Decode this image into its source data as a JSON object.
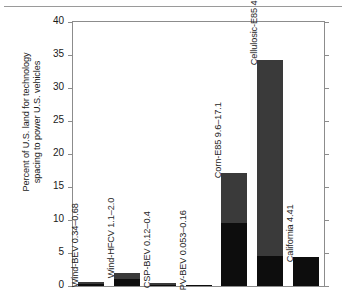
{
  "chart_data": {
    "type": "bar",
    "title": "",
    "xlabel": "",
    "ylabel": "Percent of U.S. land for technology spacing to power U.S. vehicles",
    "ylabel_line1": "Percent of U.S. land for technology",
    "ylabel_line2": "spacing to power U.S. vehicles",
    "ylim": [
      0,
      40
    ],
    "yticks": [
      0,
      5,
      10,
      15,
      20,
      25,
      30,
      35,
      40
    ],
    "ytick_labels": [
      "0",
      "5",
      "10",
      "15",
      "20",
      "25",
      "30",
      "35",
      "40"
    ],
    "grid": false,
    "legend": "none",
    "xtick_labels": [],
    "categories": [
      "Wind-BEV",
      "Wind-HFCV",
      "CSP-BEV",
      "PV-BEV",
      "Corn-E85",
      "Cellulosic-E85",
      "California"
    ],
    "bar_annotations": [
      "Wind-BEV 0.34–0.68",
      "Wind-HFCV 1.1–2.0",
      "CSP-BEV 0.12–0.4",
      "PV-BEV 0.053–0.16",
      "Corn-E85 9.6–17.1",
      "Cellulosic-E85 4.6–34.3",
      "California 4.41"
    ],
    "series": [
      {
        "name": "low estimate",
        "color": "#0d0d0d",
        "values": [
          0.34,
          1.1,
          0.12,
          0.053,
          9.6,
          4.6,
          4.41
        ]
      },
      {
        "name": "high estimate",
        "color": "#3a3a3a",
        "values": [
          0.68,
          2.0,
          0.4,
          0.16,
          17.1,
          34.3,
          4.41
        ]
      }
    ],
    "bars": [
      {
        "label": "Wind-BEV 0.34–0.68",
        "low": 0.34,
        "high": 0.68
      },
      {
        "label": "Wind-HFCV 1.1–2.0",
        "low": 1.1,
        "high": 2.0
      },
      {
        "label": "CSP-BEV 0.12–0.4",
        "low": 0.12,
        "high": 0.4
      },
      {
        "label": "PV-BEV 0.053–0.16",
        "low": 0.053,
        "high": 0.16
      },
      {
        "label": "Corn-E85 9.6–17.1",
        "low": 9.6,
        "high": 17.1
      },
      {
        "label": "Cellulosic-E85 4.6–34.3",
        "low": 4.6,
        "high": 34.3
      },
      {
        "label": "California 4.41",
        "low": 4.41,
        "high": 4.41
      }
    ]
  },
  "colors": {
    "low_segment": "#0d0d0d",
    "high_segment": "#3a3a3a",
    "axis": "#8c8c8c",
    "text": "#1a1a1a",
    "background": "#ffffff"
  }
}
